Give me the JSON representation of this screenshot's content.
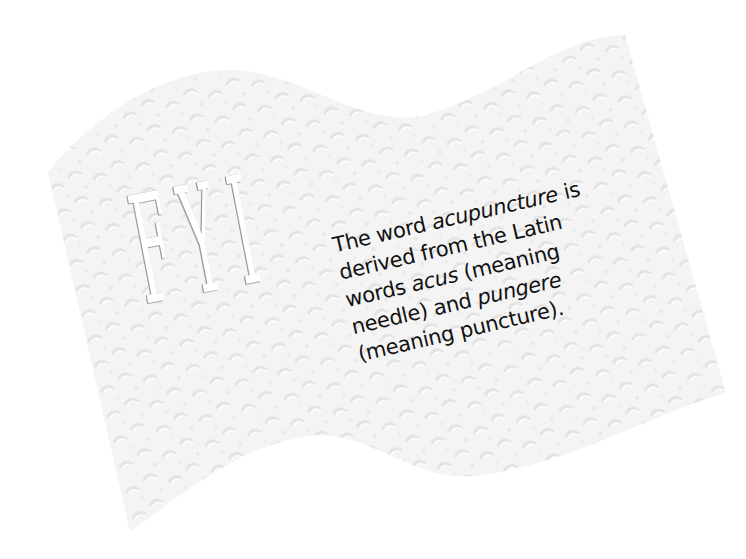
{
  "card": {
    "heading": "FYI",
    "heading_letters": [
      "F",
      "Y",
      "I"
    ],
    "fact_lines": [
      {
        "parts": [
          {
            "text": "The word ",
            "italic": false
          },
          {
            "text": "acupuncture",
            "italic": true
          },
          {
            "text": " is",
            "italic": false
          }
        ]
      },
      {
        "parts": [
          {
            "text": "derived from the Latin",
            "italic": false
          }
        ]
      },
      {
        "parts": [
          {
            "text": "words ",
            "italic": false
          },
          {
            "text": "acus",
            "italic": true
          },
          {
            "text": " (meaning",
            "italic": false
          }
        ]
      },
      {
        "parts": [
          {
            "text": "needle) and ",
            "italic": false
          },
          {
            "text": "pungere",
            "italic": true
          }
        ]
      },
      {
        "parts": [
          {
            "text": "(meaning puncture).",
            "italic": false
          }
        ]
      }
    ],
    "fact_text": "The word acupuncture is derived from the Latin words acus (meaning needle) and pungere (meaning puncture).",
    "colors": {
      "paper": "#f3f3f3",
      "paper_texture": "#e2e2e2",
      "text": "#111111",
      "emboss_shadow": "#9a9a9a",
      "background": "#ffffff"
    }
  }
}
